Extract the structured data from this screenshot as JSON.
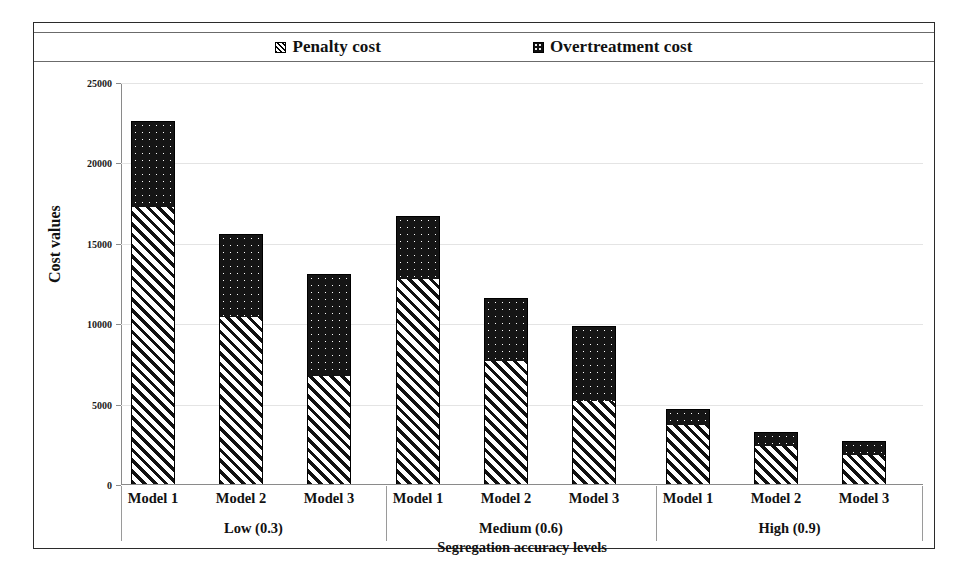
{
  "chart_data": {
    "type": "bar",
    "subtype": "stacked-grouped-bar",
    "title": "",
    "xlabel": "Segregation accuracy levels",
    "ylabel": "Cost values",
    "ylim": [
      0,
      25000
    ],
    "ytick_labels": [
      "0",
      "5000",
      "10000",
      "15000",
      "20000",
      "25000"
    ],
    "ytick_values": [
      0,
      5000,
      10000,
      15000,
      20000,
      25000
    ],
    "grid": true,
    "legend_position": "top",
    "groups": [
      {
        "label": "Low (0.3)",
        "categories": [
          "Model 1",
          "Model 2",
          "Model 3"
        ]
      },
      {
        "label": "Medium (0.6)",
        "categories": [
          "Model 1",
          "Model 2",
          "Model 3"
        ]
      },
      {
        "label": "High (0.9)",
        "categories": [
          "Model 1",
          "Model 2",
          "Model 3"
        ]
      }
    ],
    "categories": [
      "Low (0.3) / Model 1",
      "Low (0.3) / Model 2",
      "Low (0.3) / Model 3",
      "Medium (0.6) / Model 1",
      "Medium (0.6) / Model 2",
      "Medium (0.6) / Model 3",
      "High (0.9) / Model 1",
      "High (0.9) / Model 2",
      "High (0.9) / Model 3"
    ],
    "series": [
      {
        "name": "Penalty cost",
        "pattern": "diagonal-hatch",
        "color": "#111111",
        "values": [
          17300,
          10450,
          6800,
          12800,
          7700,
          5200,
          3750,
          2450,
          1850
        ]
      },
      {
        "name": "Overtreatment cost",
        "pattern": "dotted-dark",
        "color": "#151515",
        "values": [
          5350,
          5150,
          6350,
          3900,
          3900,
          4700,
          950,
          850,
          900
        ]
      }
    ],
    "totals": [
      22650,
      15600,
      13150,
      16700,
      11600,
      9900,
      4700,
      3300,
      2750
    ]
  },
  "legend": {
    "items": [
      {
        "label": "Penalty cost",
        "marker": "hatched-square-icon"
      },
      {
        "label": "Overtreatment cost",
        "marker": "filled-square-icon"
      }
    ]
  },
  "axis": {
    "y_title": "Cost values",
    "x_title": "Segregation accuracy levels",
    "y_ticks": [
      "25000",
      "20000",
      "15000",
      "10000",
      "5000",
      "0"
    ]
  },
  "x_axis_models": [
    "Model 1",
    "Model 2",
    "Model 3",
    "Model 1",
    "Model 2",
    "Model 3",
    "Model 1",
    "Model 2",
    "Model 3"
  ],
  "x_axis_groups": [
    "Low (0.3)",
    "Medium (0.6)",
    "High (0.9)"
  ]
}
